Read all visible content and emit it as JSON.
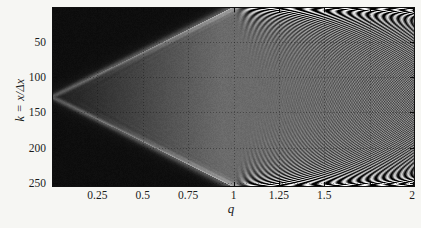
{
  "chart_data": {
    "type": "heatmap",
    "title": "",
    "xlabel": "q",
    "ylabel": "k = x/Δx",
    "x_range": [
      0,
      2
    ],
    "y_range": [
      0,
      256
    ],
    "y_axis_inverted": true,
    "x_ticks": [
      {
        "value": 0.25,
        "label": "0.25"
      },
      {
        "value": 0.5,
        "label": "0.5"
      },
      {
        "value": 0.75,
        "label": "0.75"
      },
      {
        "value": 1,
        "label": "1"
      },
      {
        "value": 1.25,
        "label": "1.25"
      },
      {
        "value": 1.5,
        "label": "1.5"
      },
      {
        "value": 1.75,
        "label": ""
      },
      {
        "value": 2,
        "label": "2"
      }
    ],
    "y_ticks": [
      {
        "value": 50,
        "label": "50"
      },
      {
        "value": 100,
        "label": "100"
      },
      {
        "value": 150,
        "label": "150"
      },
      {
        "value": 200,
        "label": "200"
      },
      {
        "value": 250,
        "label": "250"
      }
    ],
    "grid": {
      "style": "dotted",
      "opacity": 0.35
    },
    "colormap": "grayscale",
    "colors": {
      "page_background": "#f6f6f3",
      "outside_cone": "#0f0f0f",
      "plateau": "#6f6f6f",
      "front_edge": "#a8a8a8",
      "fringe_bright": "#efefef",
      "frame": "#101010",
      "text": "#1c1c1c",
      "grid_dot": "#0a0a0a",
      "tick": "#0a0a0a"
    },
    "pattern": {
      "description": "Numerical light-cone of a discretized wave equation: an impulse at k=128 on the left edge spreads as a symmetric cone whose edges reach k=0 and k=256 at Courant number q=1. The cone interior is a uniform grey plateau (darker near the tip), the exterior is near-black, and the cone fronts are soft bright bands. For q>1, chirped instability/interference fringes emerge from the top and bottom boundaries at the q=1 corners, arc toward larger q with spacing finest at the boundaries, and overlap into a fine cross-hatched moire pattern by q=2.",
      "cone_vertex": {
        "q": 0,
        "k": 128
      },
      "cone_edge_reaches_boundary_at_q": 1,
      "plateau_level": 0.42,
      "plateau_tip_ramp": [
        0.27,
        0.78
      ],
      "outside_level": 0.055,
      "outside_glow": [
        0.09,
        18
      ],
      "front_band_gain": 0.22,
      "front_band_width": [
        0.03,
        0.025
      ],
      "ripple_gain": 0.05,
      "ripple_decay": 0.07,
      "ripple_chirp": 55,
      "fringe_gain": 0.26,
      "fringe_chirp": 640,
      "fringe_depth_rate": 2.0,
      "fringe_depth_offset": 0.08,
      "fringe_ramp": 0.09,
      "fringe_edge_boost": [
        1.6,
        12
      ],
      "fringe_onset": 0.015,
      "noise": 0.05
    }
  },
  "layout": {
    "plot_px": {
      "left": 52,
      "top": 7,
      "width": 363,
      "height": 180
    }
  }
}
